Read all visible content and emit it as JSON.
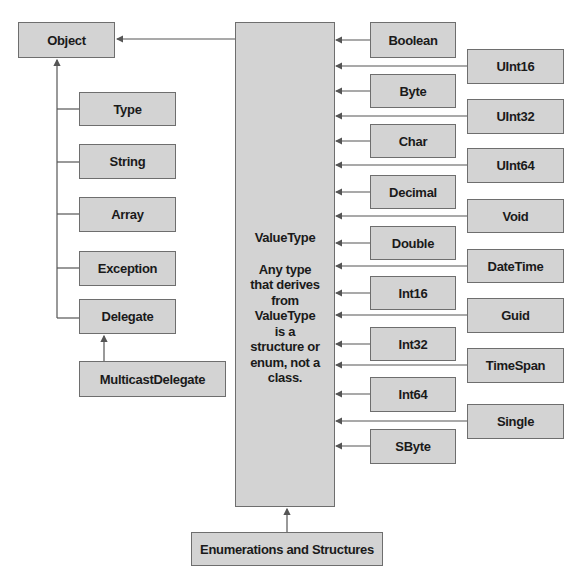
{
  "diagram": {
    "root": "Object",
    "object_children": [
      "Type",
      "String",
      "Array",
      "Exception",
      "Delegate"
    ],
    "delegate_child": "MulticastDelegate",
    "value_type": {
      "title": "ValueType",
      "description": "Any type that derives from ValueType is a structure or enum, not a class."
    },
    "value_type_child": "Enumerations and Structures",
    "value_types_inner": [
      "Boolean",
      "Byte",
      "Char",
      "Decimal",
      "Double",
      "Int16",
      "Int32",
      "Int64",
      "SByte"
    ],
    "value_types_outer": [
      "UInt16",
      "UInt32",
      "UInt64",
      "Void",
      "DateTime",
      "Guid",
      "TimeSpan",
      "Single"
    ]
  },
  "colors": {
    "box_fill": "#d3d3d3",
    "box_border": "#6e6e6e",
    "line": "#555555",
    "text": "#1a1a1a"
  }
}
